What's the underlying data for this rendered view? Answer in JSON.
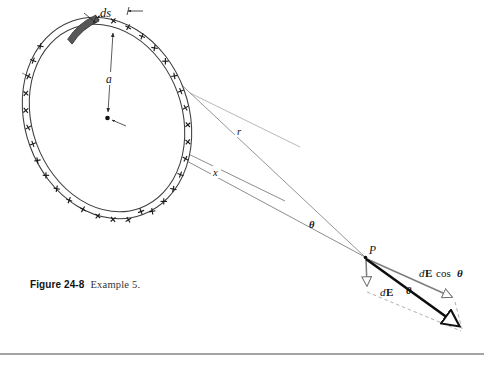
{
  "figure": {
    "caption_label": "Figure 24-8",
    "caption_text": "Example 5.",
    "background_color": "#ffffff",
    "rule_color": "#4a4a4a"
  },
  "labels": {
    "ds": "ds",
    "radius_a": "a",
    "distance_r": "r",
    "distance_x": "x",
    "angle_theta_axis": "θ",
    "angle_theta_vector": "θ",
    "point_p": "P",
    "vector_dE_d": "d",
    "vector_dE_E": "E",
    "component_d": "d",
    "component_E": "E",
    "component_cos": "cos",
    "component_theta": "θ"
  },
  "colors": {
    "ring_outline": "#3c3c3c",
    "charge_sign": "#1a1a1a",
    "ds_segment_fill": "#57575a",
    "axis_line": "#6f6f6f",
    "r_line": "#7a7a7a",
    "leader_line": "#8a8a8a",
    "vector_gray": "#7d7d7d",
    "vector_black": "#0d0d0d",
    "dashed_line": "#9a9a9a",
    "center_dot": "#111111"
  },
  "geometry": {
    "ring_center_x": 107,
    "ring_center_y": 118,
    "ring_radius_x": 82,
    "ring_radius_y": 103,
    "ring_rotation_deg": -20,
    "ring_band_width": 7,
    "charge_count": 36,
    "point_p_x": 365,
    "point_p_y": 257,
    "ds_label_x": 108,
    "ds_label_y": 12,
    "rule_y": 354
  },
  "elements": {
    "ring_name": "charged-ring",
    "ds_segment_name": "ds-charge-element",
    "center_name": "ring-center-point",
    "axis_name": "ring-axis-line",
    "r_line_name": "r-distance-line",
    "x_line_name": "x-distance-line",
    "dE_vector_name": "dE-vector",
    "dE_cos_vector_name": "dE-cos-theta-vector",
    "resultant_name": "resultant-vector"
  }
}
